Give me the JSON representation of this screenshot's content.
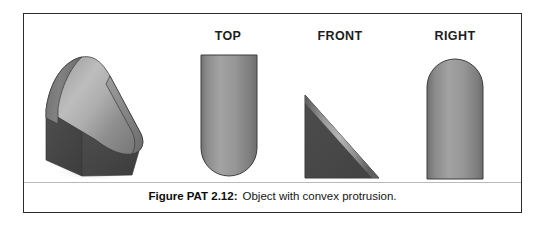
{
  "figure": {
    "caption_label": "Figure PAT 2.12:",
    "caption_text": "Object with convex protrusion.",
    "frame_border_color": "#2b2b2b",
    "background_color": "#ffffff"
  },
  "views": [
    {
      "id": "isometric",
      "label": "",
      "shape": "wedge-with-convex-rounded-protrusion",
      "description": "Pictorial isometric view of a wedge-shaped solid whose sloped upper face is a convex cylindrical protrusion"
    },
    {
      "id": "top",
      "label": "TOP",
      "shape": "rectangle-with-rounded-bottom-end",
      "description": "Rectangle with a semicircular rounded lower edge"
    },
    {
      "id": "front",
      "label": "FRONT",
      "shape": "right-triangle",
      "description": "Right triangle with vertical left leg, horizontal bottom leg and hypotenuse rising to the upper left"
    },
    {
      "id": "right",
      "label": "RIGHT",
      "shape": "rectangle-with-rounded-top-end",
      "description": "Rectangle with a semicircular rounded upper edge"
    }
  ],
  "colors": {
    "shade_light": "#b6b6b6",
    "shade_mid": "#8f8f8f",
    "shade_dark": "#666666",
    "shade_darkest": "#4a4a4a",
    "outline": "#3a3a3a",
    "divider": "#b9b9b9",
    "label_text": "#1d1d1d",
    "caption_text": "#141414"
  }
}
